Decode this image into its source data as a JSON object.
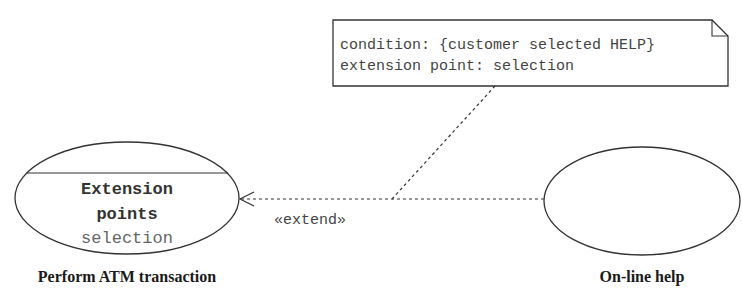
{
  "note": {
    "line1": "condition: {customer selected HELP}",
    "line2": "extension point: selection"
  },
  "base_use_case": {
    "name": "Perform ATM transaction",
    "compartment_title_line1": "Extension",
    "compartment_title_line2": "points",
    "extension_point": "selection"
  },
  "extension_use_case": {
    "name": "On-line help"
  },
  "relationship": {
    "stereotype": "«extend»"
  },
  "colors": {
    "line": "#333333",
    "text": "#333333",
    "muted_text": "#666666",
    "label_text": "#1a1a1a"
  }
}
